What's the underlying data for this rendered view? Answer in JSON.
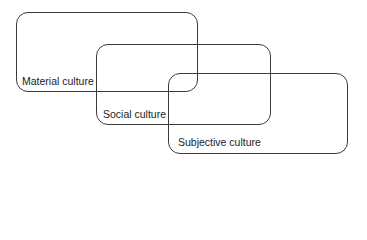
{
  "diagram": {
    "boxes": [
      {
        "label": "Material culture"
      },
      {
        "label": "Social culture"
      },
      {
        "label": "Subjective culture"
      }
    ]
  }
}
